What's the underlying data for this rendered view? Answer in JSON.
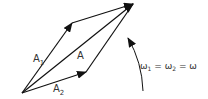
{
  "diagram": {
    "type": "phasor-addition",
    "vectors": [
      {
        "name": "A1",
        "label": "A",
        "sub": "1",
        "from": [
          22,
          93
        ],
        "to": [
          72,
          23
        ]
      },
      {
        "name": "A2",
        "label": "A",
        "sub": "2",
        "from": [
          22,
          93
        ],
        "to": [
          86,
          72
        ]
      },
      {
        "name": "A",
        "label": "A",
        "sub": "",
        "from": [
          22,
          93
        ],
        "to": [
          133,
          4
        ]
      }
    ],
    "rotation_label": {
      "w1": "ω",
      "w1_sub": "1",
      "eq1": " = ",
      "w2": "ω",
      "w2_sub": "2",
      "eq2": " = ",
      "w": "ω"
    },
    "colors": {
      "line": "#111111",
      "text": "#333333"
    }
  }
}
